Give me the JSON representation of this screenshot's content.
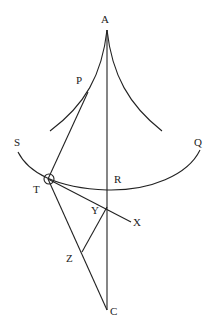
{
  "diagram": {
    "type": "geometric construction",
    "labels": {
      "A": "A",
      "P": "P",
      "S": "S",
      "Q": "Q",
      "T": "T",
      "R": "R",
      "Y": "Y",
      "X": "X",
      "Z": "Z",
      "C": "C"
    },
    "points": {
      "A": [
        107,
        30
      ],
      "P": [
        88,
        92
      ],
      "T": [
        48,
        179
      ],
      "R": [
        107,
        190
      ],
      "Y": [
        107,
        207
      ],
      "X": [
        130,
        222
      ],
      "Z": [
        82,
        252
      ],
      "C": [
        107,
        310
      ],
      "S": [
        18,
        152
      ],
      "Q": [
        200,
        150
      ]
    },
    "colors": {
      "line": "#222222",
      "background": "#ffffff"
    }
  }
}
